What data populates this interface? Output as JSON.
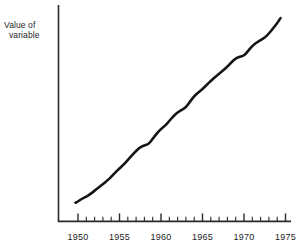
{
  "figure": {
    "background_color": "#ffffff",
    "ink_color": "#151515",
    "axis_color": "#2a2a2a"
  },
  "axes": {
    "y_title_line1": "Value of",
    "y_title_line2": "variable",
    "x_tick_labels": [
      "1950",
      "1955",
      "1960",
      "1965",
      "1970",
      "1975"
    ],
    "minor_tick_interval_label": "1"
  },
  "chart_data": {
    "type": "line",
    "title": "",
    "subtitle": "",
    "xlabel": "",
    "ylabel": "Value of variable",
    "xlim": [
      1949,
      1975.5
    ],
    "ylim": [
      0,
      100
    ],
    "grid": false,
    "legend": null,
    "axis_style": "open L-shaped axes, x-axis with major ticks every 5 years and minor ticks every year, y-axis unlabeled (no ticks, no scale numbers)",
    "annotations": [],
    "series": [
      {
        "name": "Value of variable",
        "x": [
          1949.7,
          1950.0,
          1950.5,
          1951.0,
          1951.5,
          1952.0,
          1952.5,
          1953.0,
          1953.5,
          1954.0,
          1954.5,
          1955.0,
          1955.5,
          1956.0,
          1956.5,
          1957.0,
          1957.5,
          1958.0,
          1958.5,
          1959.0,
          1959.5,
          1960.0,
          1960.5,
          1961.0,
          1961.5,
          1962.0,
          1962.5,
          1963.0,
          1963.5,
          1964.0,
          1964.5,
          1965.0,
          1965.5,
          1966.0,
          1966.5,
          1967.0,
          1967.5,
          1968.0,
          1968.5,
          1969.0,
          1969.5,
          1970.0,
          1970.5,
          1971.0,
          1971.5,
          1972.0,
          1972.5,
          1973.0,
          1973.5,
          1974.0,
          1974.4
        ],
        "y": [
          9.0,
          9.6,
          11.0,
          12.0,
          13.2,
          14.8,
          16.4,
          18.0,
          19.6,
          21.4,
          23.6,
          25.6,
          27.4,
          29.6,
          31.8,
          34.0,
          35.8,
          36.6,
          37.2,
          39.8,
          42.4,
          44.6,
          46.2,
          48.4,
          50.8,
          52.6,
          53.8,
          55.0,
          57.8,
          60.4,
          62.2,
          63.8,
          65.8,
          67.8,
          69.6,
          71.2,
          72.8,
          74.6,
          76.8,
          78.6,
          79.4,
          79.8,
          82.2,
          84.6,
          86.2,
          87.4,
          88.6,
          90.6,
          93.0,
          95.6,
          98.0
        ],
        "color": "#151515",
        "line_width_px": 2.6,
        "marker": "none",
        "smoothing": "hand-drawn, slightly wavy"
      }
    ]
  }
}
